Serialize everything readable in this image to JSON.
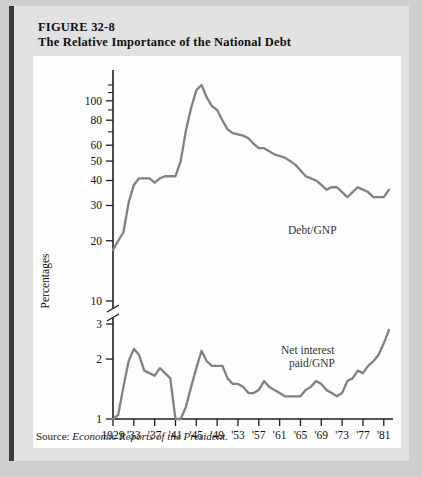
{
  "figure": {
    "number": "FIGURE 32-8",
    "title": "The Relative Importance of the National Debt",
    "source_label": "Source:",
    "source_text": "Economic Reports of the President."
  },
  "colors": {
    "page_background": "#cfcfcf",
    "panel_background": "#e2e2e2",
    "plot_background": "#fdfdfd",
    "series_line": "#808080",
    "axis": "#1d1d1d",
    "panel_edge": "#3a3a3a"
  },
  "chart_data": {
    "type": "line",
    "title": "The Relative Importance of the National Debt",
    "xlabel": "",
    "ylabel": "Percentages",
    "yscale": "log",
    "axis_break": {
      "between": [
        10,
        3
      ],
      "note": "broken y-axis between 10 and 3"
    },
    "grid": false,
    "legend_position": "inline-annotation",
    "upper_axis": {
      "ticks": [
        10,
        20,
        30,
        40,
        50,
        60,
        80,
        100
      ],
      "labeled": [
        10,
        20,
        30,
        40,
        50,
        60,
        80,
        100
      ],
      "range": [
        10,
        130
      ]
    },
    "lower_axis": {
      "ticks": [
        1,
        2,
        3
      ],
      "labeled": [
        1,
        2,
        3
      ],
      "range": [
        1,
        3
      ]
    },
    "xticks": [
      "1929",
      "'33",
      "'37",
      "'41",
      "'45",
      "'49",
      "'53",
      "'57",
      "'61",
      "'65",
      "'69",
      "'73",
      "'77",
      "'81"
    ],
    "xlim": [
      1929,
      1982
    ],
    "series": [
      {
        "name": "Debt/GNP",
        "panel": "upper",
        "x": [
          1929,
          1930,
          1931,
          1932,
          1933,
          1934,
          1935,
          1936,
          1937,
          1938,
          1939,
          1940,
          1941,
          1942,
          1943,
          1944,
          1945,
          1946,
          1947,
          1948,
          1949,
          1950,
          1951,
          1952,
          1953,
          1954,
          1955,
          1956,
          1957,
          1958,
          1959,
          1960,
          1961,
          1962,
          1963,
          1964,
          1965,
          1966,
          1967,
          1968,
          1969,
          1970,
          1971,
          1972,
          1973,
          1974,
          1975,
          1976,
          1977,
          1978,
          1979,
          1980,
          1981,
          1982
        ],
        "values": [
          18,
          20,
          22,
          31,
          38,
          41,
          41,
          41,
          39,
          41,
          42,
          42,
          42,
          50,
          71,
          92,
          113,
          120,
          104,
          94,
          90,
          80,
          72,
          69,
          68,
          67,
          65,
          61,
          58,
          58,
          56,
          54,
          53,
          52,
          50,
          48,
          45,
          42,
          41,
          40,
          38,
          36,
          37,
          37,
          35,
          33,
          35,
          37,
          36,
          35,
          33,
          33,
          33,
          36
        ]
      },
      {
        "name": "Net interest paid/GNP",
        "panel": "lower",
        "x": [
          1929,
          1930,
          1931,
          1932,
          1933,
          1934,
          1935,
          1936,
          1937,
          1938,
          1939,
          1940,
          1941,
          1942,
          1943,
          1944,
          1945,
          1946,
          1947,
          1948,
          1949,
          1950,
          1951,
          1952,
          1953,
          1954,
          1955,
          1956,
          1957,
          1958,
          1959,
          1960,
          1961,
          1962,
          1963,
          1964,
          1965,
          1966,
          1967,
          1968,
          1969,
          1970,
          1971,
          1972,
          1973,
          1974,
          1975,
          1976,
          1977,
          1978,
          1979,
          1980,
          1981,
          1982
        ],
        "values": [
          1.0,
          1.05,
          1.45,
          1.95,
          2.25,
          2.1,
          1.75,
          1.7,
          1.65,
          1.8,
          1.7,
          1.6,
          1.0,
          1.0,
          1.15,
          1.45,
          1.8,
          2.2,
          1.95,
          1.85,
          1.85,
          1.85,
          1.6,
          1.5,
          1.5,
          1.45,
          1.35,
          1.35,
          1.4,
          1.55,
          1.45,
          1.4,
          1.35,
          1.3,
          1.3,
          1.3,
          1.3,
          1.4,
          1.45,
          1.55,
          1.5,
          1.4,
          1.35,
          1.3,
          1.35,
          1.55,
          1.6,
          1.75,
          1.7,
          1.85,
          1.95,
          2.1,
          2.4,
          2.8
        ]
      }
    ],
    "annotations": [
      {
        "text": "Debt/GNP",
        "x": 1966,
        "panel": "upper"
      },
      {
        "text": "Net interest",
        "x": 1970,
        "panel": "lower"
      },
      {
        "text": "paid/GNP",
        "x": 1970,
        "panel": "lower"
      }
    ]
  }
}
